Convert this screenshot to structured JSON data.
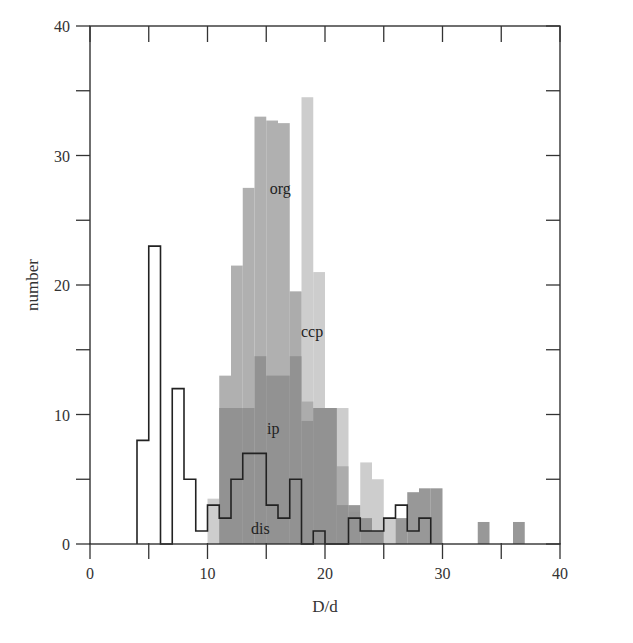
{
  "chart_data": {
    "type": "bar",
    "title": "",
    "xlabel": "D/d",
    "ylabel": "number",
    "xlim": [
      0,
      40
    ],
    "ylim": [
      0,
      40
    ],
    "xticks": [
      0,
      10,
      20,
      30,
      40
    ],
    "yticks": [
      0,
      10,
      20,
      30,
      40
    ],
    "minor_xticks": [
      5,
      15,
      25,
      35
    ],
    "minor_yticks": [
      5,
      15,
      25,
      35
    ],
    "grid": false,
    "legend": "inline labels",
    "bin_width": 1,
    "series": [
      {
        "name": "org",
        "style": "filled",
        "color": "#a9a9a9",
        "bins": [
          {
            "x0": 11,
            "value": 13
          },
          {
            "x0": 12,
            "value": 21.5
          },
          {
            "x0": 13,
            "value": 27.5
          },
          {
            "x0": 14,
            "value": 33
          },
          {
            "x0": 15,
            "value": 32.7
          },
          {
            "x0": 16,
            "value": 32.5
          },
          {
            "x0": 17,
            "value": 19.5
          },
          {
            "x0": 18,
            "value": 11
          },
          {
            "x0": 19,
            "value": 10.5
          },
          {
            "x0": 20,
            "value": 10.5
          },
          {
            "x0": 21,
            "value": 6
          }
        ]
      },
      {
        "name": "ccp",
        "style": "filled",
        "color": "#c9c9c9",
        "bins": [
          {
            "x0": 10,
            "value": 3.5
          },
          {
            "x0": 17,
            "value": 19.5
          },
          {
            "x0": 18,
            "value": 34.5
          },
          {
            "x0": 19,
            "value": 21
          },
          {
            "x0": 20,
            "value": 10.5
          },
          {
            "x0": 21,
            "value": 10.5
          },
          {
            "x0": 22,
            "value": 2.5
          },
          {
            "x0": 23,
            "value": 6.3
          },
          {
            "x0": 24,
            "value": 5
          },
          {
            "x0": 25,
            "value": 2
          }
        ]
      },
      {
        "name": "ip",
        "style": "filled",
        "color": "#8f8f8f",
        "bins": [
          {
            "x0": 11,
            "value": 10.5
          },
          {
            "x0": 12,
            "value": 10.5
          },
          {
            "x0": 13,
            "value": 10.5
          },
          {
            "x0": 14,
            "value": 14.5
          },
          {
            "x0": 15,
            "value": 13
          },
          {
            "x0": 16,
            "value": 13
          },
          {
            "x0": 17,
            "value": 14.5
          },
          {
            "x0": 18,
            "value": 9.5
          },
          {
            "x0": 19,
            "value": 10.5
          },
          {
            "x0": 20,
            "value": 10.5
          },
          {
            "x0": 21,
            "value": 3
          },
          {
            "x0": 22,
            "value": 3
          },
          {
            "x0": 23,
            "value": 2
          },
          {
            "x0": 24,
            "value": 1
          },
          {
            "x0": 26,
            "value": 2
          },
          {
            "x0": 27,
            "value": 4
          },
          {
            "x0": 28,
            "value": 4.3
          },
          {
            "x0": 29,
            "value": 4.3
          },
          {
            "x0": 33,
            "value": 1.7
          },
          {
            "x0": 36,
            "value": 1.7
          }
        ]
      },
      {
        "name": "dis",
        "style": "outline",
        "color": "#222222",
        "bins": [
          {
            "x0": 4,
            "value": 8
          },
          {
            "x0": 5,
            "value": 23
          },
          {
            "x0": 6,
            "value": 0
          },
          {
            "x0": 7,
            "value": 12
          },
          {
            "x0": 8,
            "value": 5
          },
          {
            "x0": 9,
            "value": 1
          },
          {
            "x0": 10,
            "value": 3
          },
          {
            "x0": 11,
            "value": 2
          },
          {
            "x0": 12,
            "value": 5
          },
          {
            "x0": 13,
            "value": 7
          },
          {
            "x0": 14,
            "value": 7
          },
          {
            "x0": 15,
            "value": 3
          },
          {
            "x0": 16,
            "value": 2
          },
          {
            "x0": 17,
            "value": 5
          },
          {
            "x0": 18,
            "value": 0
          },
          {
            "x0": 19,
            "value": 1
          },
          {
            "x0": 20,
            "value": 0
          },
          {
            "x0": 21,
            "value": 0
          },
          {
            "x0": 22,
            "value": 2
          },
          {
            "x0": 23,
            "value": 1
          },
          {
            "x0": 24,
            "value": 1
          },
          {
            "x0": 25,
            "value": 2
          },
          {
            "x0": 26,
            "value": 3
          },
          {
            "x0": 27,
            "value": 1
          },
          {
            "x0": 28,
            "value": 2
          }
        ]
      }
    ],
    "annotations": [
      {
        "text": "org",
        "x": 16.2,
        "y": 27
      },
      {
        "text": "ccp",
        "x": 18.9,
        "y": 16
      },
      {
        "text": "ip",
        "x": 15.6,
        "y": 8.5
      },
      {
        "text": "dis",
        "x": 14.5,
        "y": 0.8
      }
    ]
  }
}
